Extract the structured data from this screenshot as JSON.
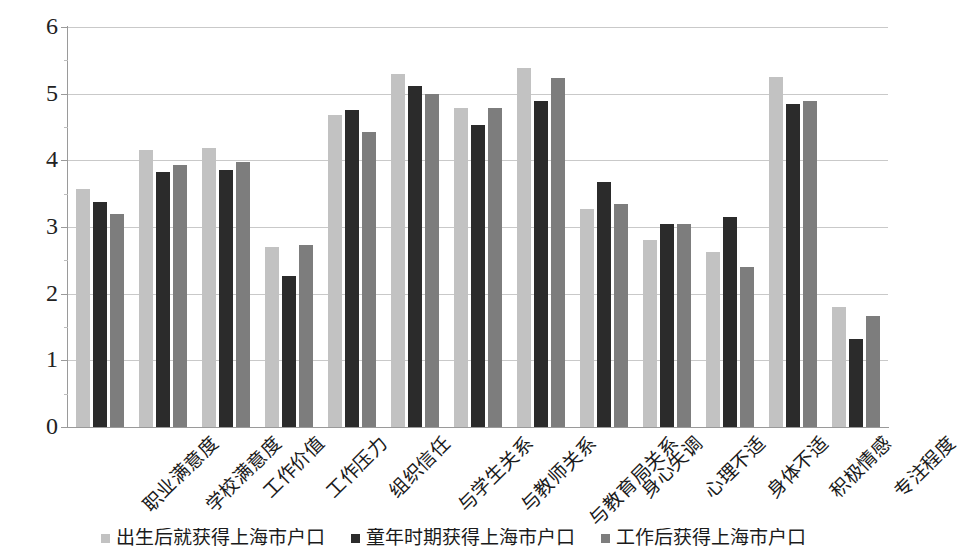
{
  "chart_data": {
    "type": "bar",
    "title": "",
    "subtitle": "",
    "xlabel": "",
    "ylabel": "",
    "ylim": [
      0,
      6
    ],
    "yticks": [
      0,
      1,
      2,
      3,
      4,
      5,
      6
    ],
    "grid": true,
    "legend_position": "bottom",
    "orientation": "vertical",
    "grouped": true,
    "categories": [
      "职业满意度",
      "学校满意度",
      "工作价值",
      "工作压力",
      "组织信任",
      "与学生关系",
      "与教师关系",
      "与教育局关系",
      "身心失调",
      "心理不适",
      "身体不适",
      "积极情感",
      "专注程度"
    ],
    "series": [
      {
        "name": "出生后就获得上海市户口",
        "color": "#c2c2c2",
        "values": [
          3.57,
          4.16,
          4.18,
          2.7,
          4.68,
          5.3,
          4.79,
          5.38,
          3.27,
          2.8,
          2.63,
          5.25,
          1.8
        ]
      },
      {
        "name": "童年时期获得上海市户口",
        "color": "#2b2b2b",
        "values": [
          3.38,
          3.82,
          3.86,
          2.26,
          4.76,
          5.12,
          4.53,
          4.89,
          3.68,
          3.05,
          3.15,
          4.84,
          1.32
        ]
      },
      {
        "name": "工作后获得上海市户口",
        "color": "#7d7d7d",
        "values": [
          3.19,
          3.93,
          3.98,
          2.73,
          4.43,
          5.0,
          4.78,
          5.24,
          3.34,
          3.04,
          2.4,
          4.89,
          1.67
        ]
      }
    ]
  },
  "axis": {
    "y_tick_labels": [
      "0",
      "1",
      "2",
      "3",
      "4",
      "5",
      "6"
    ]
  }
}
